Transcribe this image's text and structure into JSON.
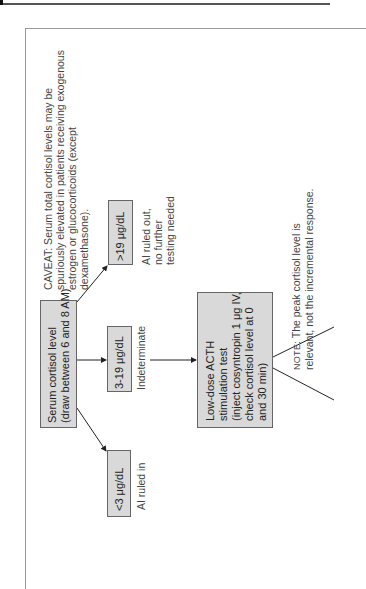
{
  "diagram": {
    "orientation": "rotated-90-ccw",
    "caveat": {
      "lines": [
        "CAVEAT: Serum total cortisol levels may be",
        "spuriously elevated in patients receiving exogenous",
        "estrogen or glucocorticoids (except",
        "dexamethasone)."
      ]
    },
    "start_node": {
      "lines": [
        "Serum cortisol level",
        "(draw between 6 and 8 AM)"
      ]
    },
    "branches": [
      {
        "id": "high",
        "label": ">19 μg/dL",
        "outcome_lines": [
          "AI ruled out,",
          "no further",
          "testing needed"
        ]
      },
      {
        "id": "mid",
        "label": "3-19 μg/dL",
        "outcome_lines": [
          "Indeterminate"
        ]
      },
      {
        "id": "low",
        "label": "<3 μg/dL",
        "outcome_lines": [
          "AI ruled in"
        ]
      }
    ],
    "acth_node": {
      "lines": [
        "Low-dose ACTH",
        "stimulation test",
        "(inject cosyntropin 1 μg IV,",
        "check cortisol level at 0",
        "and 30 min)"
      ]
    },
    "note": {
      "prefix": "NOTE:",
      "lines": [
        "The peak cortisol level is",
        "relevant, not the incremental response."
      ]
    },
    "colors": {
      "box_fill": "#d9d9d9",
      "box_border": "#666666",
      "line": "#222222",
      "text": "#333333"
    }
  }
}
